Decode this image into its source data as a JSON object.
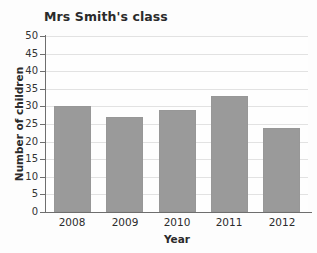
{
  "chart_data": {
    "type": "bar",
    "title": "Mrs Smith's class",
    "xlabel": "Year",
    "ylabel": "Number of children",
    "categories": [
      "2008",
      "2009",
      "2010",
      "2011",
      "2012"
    ],
    "values": [
      30,
      27,
      29,
      33,
      24
    ],
    "ylim": [
      0,
      50
    ],
    "ytick_step": 5,
    "yticks": [
      "50",
      "45",
      "40",
      "35",
      "30",
      "25",
      "20",
      "15",
      "10",
      "5",
      "0"
    ],
    "ytick_values": [
      50,
      45,
      40,
      35,
      30,
      25,
      20,
      15,
      10,
      5,
      0
    ],
    "grid": true,
    "legend": false,
    "bar_color": "#9a9a9a",
    "grid_color": "#e2e2e2",
    "axis_color": "#6e6e6e",
    "text_color": "#2b2b2b",
    "background": "#fdfdfd"
  }
}
